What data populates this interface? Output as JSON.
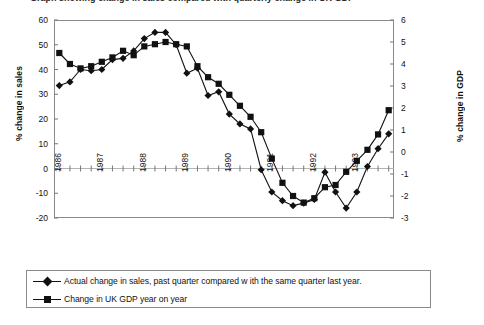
{
  "title": "Graph showing change in sales compared with quarterly change in UK GDP",
  "axes": {
    "left_label": "% change in sales",
    "right_label": "% change in GDP",
    "left_ticks": [
      "60",
      "50",
      "40",
      "30",
      "20",
      "10",
      "0",
      "-10",
      "-20"
    ],
    "right_ticks": [
      "6",
      "5",
      "4",
      "3",
      "2",
      "1",
      "0",
      "-1",
      "-2",
      "-3"
    ],
    "x_labels": [
      "1986",
      "1987",
      "1988",
      "1989",
      "1990",
      "1991",
      "1992",
      "1993"
    ]
  },
  "legend": {
    "items": [
      {
        "marker": "diamond-marker",
        "label": "Actual change in sales, past quarter compared w ith the same quarter last year."
      },
      {
        "marker": "square-marker",
        "label": "Change in UK GDP year on year"
      }
    ]
  },
  "colors": {
    "line": "#111111",
    "frame": "#8a8a8a",
    "gridline": "#b4b4b4"
  },
  "chart_data": {
    "type": "line",
    "title": "Graph showing change in sales compared with quarterly change in UK GDP",
    "xlabel": "",
    "ylabel": "% change in sales",
    "y2label": "% change in GDP",
    "ylim": [
      -20,
      60
    ],
    "y2lim": [
      -3,
      6
    ],
    "yticks": [
      -20,
      -10,
      0,
      10,
      20,
      30,
      40,
      50,
      60
    ],
    "y2ticks": [
      -3,
      -2,
      -1,
      0,
      1,
      2,
      3,
      4,
      5,
      6
    ],
    "grid": false,
    "legend_position": "bottom",
    "x": [
      "1986 Q1",
      "1986 Q2",
      "1986 Q3",
      "1986 Q4",
      "1987 Q1",
      "1987 Q2",
      "1987 Q3",
      "1987 Q4",
      "1988 Q1",
      "1988 Q2",
      "1988 Q3",
      "1988 Q4",
      "1989 Q1",
      "1989 Q2",
      "1989 Q3",
      "1989 Q4",
      "1990 Q1",
      "1990 Q2",
      "1990 Q3",
      "1990 Q4",
      "1991 Q1",
      "1991 Q2",
      "1991 Q3",
      "1991 Q4",
      "1992 Q1",
      "1992 Q2",
      "1992 Q3",
      "1992 Q4",
      "1993 Q1",
      "1993 Q2",
      "1993 Q3",
      "1993 Q4"
    ],
    "series": [
      {
        "name": "Actual change in sales, past quarter compared w ith the same quarter last year.",
        "axis": "left",
        "units": "% change in sales",
        "marker": "diamond",
        "values": [
          33.5,
          35.0,
          40.0,
          39.5,
          40.0,
          44.0,
          44.5,
          47.5,
          52.5,
          55.0,
          55.0,
          50.0,
          38.5,
          40.5,
          29.5,
          31.0,
          22.0,
          18.0,
          16.0,
          -0.5,
          -9.5,
          -13.0,
          -15.0,
          -14.0,
          -12.5,
          -1.5,
          -9.5,
          -16.0,
          -9.5,
          0.8,
          8.0,
          14.0
        ]
      },
      {
        "name": "Change in UK GDP year on year",
        "axis": "right",
        "units": "% change in GDP",
        "marker": "square",
        "values": [
          4.5,
          4.0,
          3.8,
          3.9,
          4.1,
          4.3,
          4.6,
          4.4,
          4.8,
          4.9,
          5.0,
          4.9,
          4.8,
          3.9,
          3.4,
          3.1,
          2.6,
          2.1,
          1.6,
          0.9,
          -0.3,
          -1.4,
          -2.0,
          -2.3,
          -2.1,
          -1.6,
          -1.5,
          -0.9,
          -0.4,
          0.1,
          0.8,
          1.9
        ]
      }
    ]
  }
}
